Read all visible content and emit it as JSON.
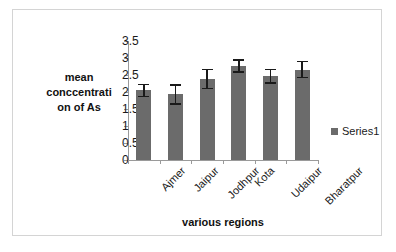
{
  "chart_data": {
    "type": "bar",
    "title": "",
    "xlabel": "various regions",
    "ylabel": "mean conccentrati on of As",
    "ylabel_lines": [
      "mean",
      "conccentrati",
      "on of As"
    ],
    "categories": [
      "Ajmer",
      "Jaipur",
      "Jodhpur",
      "Kota",
      "Udaipur",
      "Bharatpur"
    ],
    "values": [
      2.05,
      1.93,
      2.38,
      2.77,
      2.46,
      2.66
    ],
    "errors": [
      0.2,
      0.3,
      0.3,
      0.2,
      0.22,
      0.26
    ],
    "series": [
      {
        "name": "Series1",
        "values": [
          2.05,
          1.93,
          2.38,
          2.77,
          2.46,
          2.66
        ],
        "errors": [
          0.2,
          0.3,
          0.3,
          0.2,
          0.22,
          0.26
        ]
      }
    ],
    "ylim": [
      0,
      3.5
    ],
    "yticks": [
      0,
      0.5,
      1,
      1.5,
      2,
      2.5,
      3,
      3.5
    ],
    "ytick_labels": [
      "0",
      "0.5",
      "1",
      "1.5",
      "2",
      "2.5",
      "3",
      "3.5"
    ],
    "grid": false,
    "legend": {
      "position": "right",
      "entries": [
        {
          "label": "Series1",
          "color": "#6b6b6b",
          "marker": "square"
        }
      ]
    },
    "bar_color": "#6b6b6b",
    "axis_color": "#9a9a9a",
    "error_bar_color": "#1a1a1a",
    "category_label_rotation": -45
  }
}
